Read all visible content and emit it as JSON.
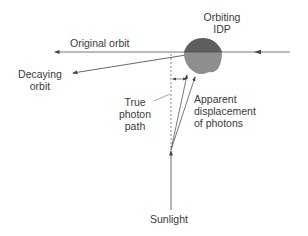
{
  "diagram": {
    "labels": {
      "orbiting_idp_line1": "Orbiting",
      "orbiting_idp_line2": "IDP",
      "original_orbit": "Original orbit",
      "decaying_orbit_line1": "Decaying",
      "decaying_orbit_line2": "orbit",
      "true_photon_path_line1": "True",
      "true_photon_path_line2": "photon",
      "true_photon_path_line3": "path",
      "apparent_displacement_line1": "Apparent",
      "apparent_displacement_line2": "displacement",
      "apparent_displacement_line3": "of photons",
      "sunlight": "Sunlight"
    },
    "colors": {
      "line": "#555555",
      "idp_dark": "#5e5e5e",
      "idp_light": "#8e8e8e",
      "text": "#3a3a3a"
    }
  }
}
